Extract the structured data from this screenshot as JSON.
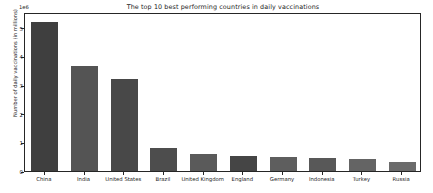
{
  "chart_data": {
    "type": "bar",
    "title": "The top 10 best performing countries in daily vaccinations",
    "xlabel": "",
    "ylabel": "Number of daily vaccinations (in millions)",
    "offset_text": "1e6",
    "categories": [
      "China",
      "India",
      "United States",
      "Brazil",
      "United Kingdom",
      "England",
      "Germany",
      "Indonesia",
      "Turkey",
      "Russia"
    ],
    "values": [
      5200000,
      3650000,
      3220000,
      820000,
      610000,
      520000,
      480000,
      450000,
      420000,
      330000
    ],
    "values_scaled": [
      5.2,
      3.65,
      3.22,
      0.82,
      0.61,
      0.52,
      0.48,
      0.45,
      0.42,
      0.33
    ],
    "ylim": [
      0,
      5.55
    ],
    "yticks": [
      "0",
      "1",
      "2",
      "3",
      "4",
      "5"
    ],
    "ytick_values": [
      0,
      1,
      2,
      3,
      4,
      5
    ],
    "grid": false,
    "legend": "none",
    "bar_colors": [
      "#3f3f3f",
      "#545454",
      "#484848",
      "#4d4d4d",
      "#5a5a5a",
      "#454545",
      "#5e5e5e",
      "#585858",
      "#646464",
      "#6b6b6b"
    ],
    "axis_color": "#262626",
    "background_color": "#ffffff"
  }
}
